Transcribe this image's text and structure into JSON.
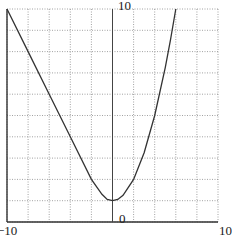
{
  "chart_data": {
    "type": "line",
    "title": "",
    "xlabel": "",
    "ylabel": "",
    "xlim": [
      -10,
      10
    ],
    "ylim": [
      0,
      10
    ],
    "grid": true,
    "grid_style": "dotted",
    "grid_step": {
      "x": 2,
      "y": 1
    },
    "tick_labels": {
      "x_left": "−10",
      "x_right": "10",
      "y_top": "10",
      "origin": "0"
    },
    "series": [
      {
        "name": "f(x)",
        "color": "#333333",
        "x": [
          -10,
          -8,
          -6,
          -4,
          -2,
          -1,
          -0.5,
          0,
          0.5,
          1,
          2,
          3,
          4,
          5,
          5.5,
          6
        ],
        "y": [
          10,
          8,
          6,
          4,
          2,
          1.3,
          1.06,
          1,
          1.06,
          1.25,
          2,
          3.25,
          5,
          7.25,
          8.56,
          10
        ]
      }
    ]
  },
  "labels": {
    "y_top": "10",
    "origin": "0",
    "x_left": "−10",
    "x_right": "10"
  }
}
